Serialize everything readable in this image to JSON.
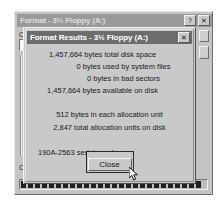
{
  "background_window": {
    "title": "Format - 3½ Floppy (A:)",
    "titlebar_buttons": [
      {
        "name": "help-button",
        "label": "?"
      },
      {
        "name": "close-button",
        "label": "✕"
      }
    ],
    "capacity_label": "C",
    "bottom_label": "C",
    "progress": {
      "name": "format-progress-bar",
      "segments": 26
    }
  },
  "dialog": {
    "title": "Format Results - 3½ Floppy (A:)",
    "close_x_label": "✕",
    "stats_disk": [
      "1,457,664 bytes total disk space",
      "0 bytes used by system files",
      "0 bytes in bad sectors",
      "1,457,664 bytes available on disk"
    ],
    "stats_allocation": [
      "512 bytes in each allocation unit",
      "2,847 total allocation units on disk"
    ],
    "serial_line": "190A-2563 serial number",
    "close_button_label": "Close"
  }
}
